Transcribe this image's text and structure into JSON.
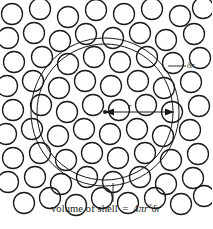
{
  "figure": {
    "caption": {
      "prefix": "volume of shell",
      "equals": "=",
      "coefficient": "4",
      "pi": "π",
      "radius_var": "r",
      "radius_exponent": "2",
      "thickness": "δr"
    },
    "annotations": {
      "shell_thickness_label": "δr",
      "radius_label": "r"
    },
    "colors": {
      "stroke": "#1a1a1a",
      "background": "#ffffff",
      "text": "#1a1a1a"
    },
    "geometry": {
      "center_x": 105,
      "center_y": 112,
      "inner_radius": 68,
      "outer_radius": 74,
      "particle_radius": 10.5,
      "particle_count": 72
    },
    "particles": [
      [
        12,
        14
      ],
      [
        40,
        9
      ],
      [
        68,
        17
      ],
      [
        96,
        10
      ],
      [
        124,
        14
      ],
      [
        152,
        9
      ],
      [
        180,
        16
      ],
      [
        203,
        8
      ],
      [
        8,
        38
      ],
      [
        34,
        33
      ],
      [
        60,
        41
      ],
      [
        86,
        34
      ],
      [
        113,
        38
      ],
      [
        140,
        33
      ],
      [
        166,
        40
      ],
      [
        194,
        34
      ],
      [
        14,
        62
      ],
      [
        42,
        57
      ],
      [
        68,
        64
      ],
      [
        94,
        57
      ],
      [
        120,
        62
      ],
      [
        147,
        57
      ],
      [
        173,
        63
      ],
      [
        200,
        58
      ],
      [
        7,
        86
      ],
      [
        33,
        81
      ],
      [
        59,
        88
      ],
      [
        85,
        81
      ],
      [
        111,
        86
      ],
      [
        138,
        81
      ],
      [
        164,
        88
      ],
      [
        191,
        82
      ],
      [
        13,
        110
      ],
      [
        41,
        105
      ],
      [
        67,
        112
      ],
      [
        93,
        105
      ],
      [
        119,
        110
      ],
      [
        146,
        105
      ],
      [
        172,
        112
      ],
      [
        199,
        106
      ],
      [
        6,
        134
      ],
      [
        32,
        129
      ],
      [
        58,
        136
      ],
      [
        84,
        129
      ],
      [
        110,
        134
      ],
      [
        137,
        129
      ],
      [
        163,
        136
      ],
      [
        190,
        130
      ],
      [
        13,
        158
      ],
      [
        40,
        153
      ],
      [
        66,
        160
      ],
      [
        92,
        153
      ],
      [
        118,
        158
      ],
      [
        145,
        153
      ],
      [
        171,
        160
      ],
      [
        198,
        154
      ],
      [
        8,
        182
      ],
      [
        35,
        177
      ],
      [
        61,
        184
      ],
      [
        87,
        177
      ],
      [
        113,
        182
      ],
      [
        140,
        177
      ],
      [
        166,
        184
      ],
      [
        193,
        178
      ],
      [
        24,
        203
      ],
      [
        50,
        198
      ],
      [
        76,
        205
      ],
      [
        102,
        198
      ],
      [
        128,
        203
      ],
      [
        155,
        198
      ],
      [
        181,
        204
      ],
      [
        204,
        196
      ]
    ]
  }
}
